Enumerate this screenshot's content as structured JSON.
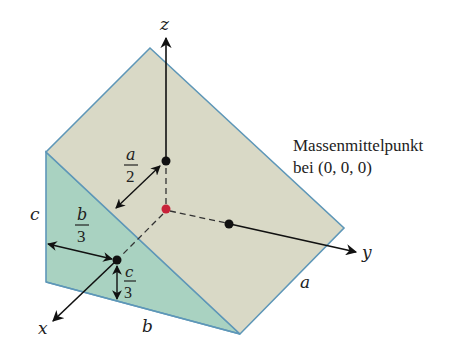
{
  "colors": {
    "top_face": "#d9d9c6",
    "side_face": "#a9d2c1",
    "edge": "#5e97b8",
    "axis": "#111111",
    "center_of_mass": "#c8233a",
    "point": "#111111"
  },
  "axes": {
    "x": "x",
    "y": "y",
    "z": "z"
  },
  "dimensions": {
    "a": "a",
    "b": "b",
    "c": "c"
  },
  "fractions": {
    "a_half": {
      "num": "a",
      "den": "2"
    },
    "b_third": {
      "num": "b",
      "den": "3"
    },
    "c_third": {
      "num": "c",
      "den": "3"
    }
  },
  "annotation": {
    "line1": "Massenmittelpunkt",
    "line2": "bei (0, 0, 0)"
  }
}
